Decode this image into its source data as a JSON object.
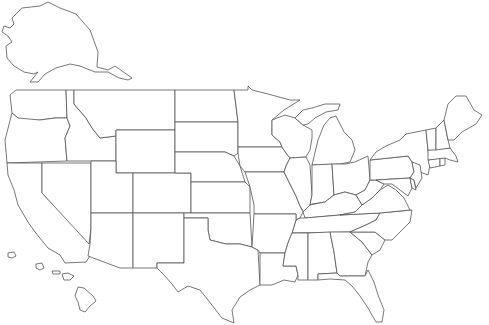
{
  "map": {
    "type": "blank-outline",
    "region": "United States",
    "background": "#ffffff",
    "stroke_color": "#555555",
    "fill_color": "#ffffff",
    "labels": [],
    "insets": [
      "Alaska",
      "Hawaii"
    ]
  }
}
